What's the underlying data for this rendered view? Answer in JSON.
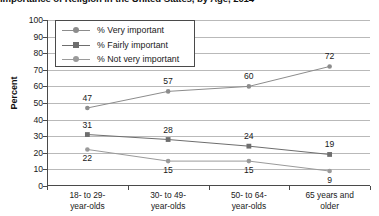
{
  "chart_data": {
    "type": "line",
    "title": "Importance of Religion in the United States, by Age, 2014",
    "xlabel": "",
    "ylabel": "Percent",
    "ylim": [
      0,
      100
    ],
    "ytick_step": 10,
    "yticks": [
      "100",
      "90",
      "80",
      "70",
      "60",
      "50",
      "40",
      "30",
      "20",
      "10",
      "0"
    ],
    "grid": true,
    "legend_position": "top-left-inside",
    "categories": [
      "18- to 29-\nyear-olds",
      "30- to 49-\nyear-olds",
      "50- to 64-\nyear-olds",
      "65 years and\nolder"
    ],
    "category_lines": [
      [
        "18- to 29-",
        "year-olds"
      ],
      [
        "30- to 49-",
        "year-olds"
      ],
      [
        "50- to 64-",
        "year-olds"
      ],
      [
        "65 years and",
        "older"
      ]
    ],
    "series": [
      {
        "name": "% Very important",
        "marker": "circle",
        "color": "#8c8c8c",
        "values": [
          47,
          57,
          60,
          72
        ],
        "label_positions": [
          "above",
          "above",
          "above",
          "above"
        ]
      },
      {
        "name": "% Fairly important",
        "marker": "square",
        "color": "#6e6e6e",
        "values": [
          31,
          28,
          24,
          19
        ],
        "label_positions": [
          "above",
          "above",
          "above",
          "above"
        ]
      },
      {
        "name": "% Not very important",
        "marker": "circle",
        "color": "#9a9a9a",
        "values": [
          22,
          15,
          15,
          9
        ],
        "label_positions": [
          "below",
          "below",
          "below",
          "below"
        ]
      }
    ]
  },
  "legend": {
    "items": [
      {
        "label": "% Very important"
      },
      {
        "label": "% Fairly important"
      },
      {
        "label": "% Not very important"
      }
    ]
  },
  "axes": {
    "y_title": "Percent",
    "y_labels": [
      "100",
      "90",
      "80",
      "70",
      "60",
      "50",
      "40",
      "30",
      "20",
      "10",
      "0"
    ],
    "x_labels": [
      {
        "line1": "18- to 29-",
        "line2": "year-olds"
      },
      {
        "line1": "30- to 49-",
        "line2": "year-olds"
      },
      {
        "line1": "50- to 64-",
        "line2": "year-olds"
      },
      {
        "line1": "65 years and",
        "line2": "older"
      }
    ]
  },
  "point_labels": {
    "very_important": [
      "47",
      "57",
      "60",
      "72"
    ],
    "fairly_important": [
      "31",
      "28",
      "24",
      "19"
    ],
    "not_very_important": [
      "22",
      "15",
      "15",
      "9"
    ]
  },
  "title": {
    "text": "Importance of Religion in the United States, by Age, 2014"
  },
  "colors": {
    "axis": "#4a4a4a",
    "grid": "#b9b9b9",
    "series_very": "#8c8c8c",
    "series_fairly": "#6e6e6e",
    "series_not_very": "#9a9a9a",
    "text": "#1a1a1a"
  }
}
